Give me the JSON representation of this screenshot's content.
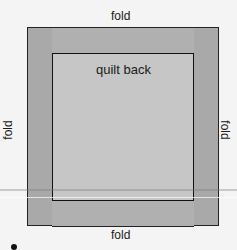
{
  "diagram": {
    "labels": {
      "top": "fold",
      "bottom": "fold",
      "left": "fold",
      "right": "fold",
      "center": "quilt back"
    },
    "colors": {
      "background": "#f4f4f4",
      "side_strips": "#a9a9a9",
      "top_bottom_bands": "#b0b0b0",
      "quilt_back": "#c6c6c6",
      "outline": "#111111"
    }
  }
}
